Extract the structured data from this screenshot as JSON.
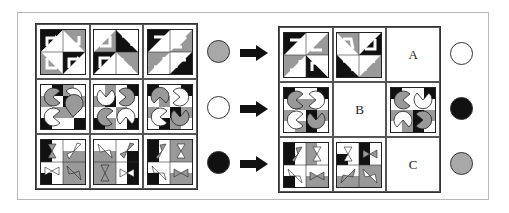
{
  "colors": {
    "black": "#111111",
    "gray": "#9a9a9a",
    "white": "#ffffff",
    "line": "#333333",
    "frame": "#b8b8b8"
  },
  "left_grid": {
    "rows": [
      {
        "pattern": "bent-arrows",
        "cells": [
          "arrows-1",
          "arrows-2",
          "arrows-3"
        ]
      },
      {
        "pattern": "pacman-tiles",
        "cells": [
          "pacman-1",
          "pacman-2",
          "pacman-3"
        ]
      },
      {
        "pattern": "bowtie-triangles",
        "cells": [
          "bowtie-1",
          "bowtie-2",
          "bowtie-3"
        ]
      }
    ]
  },
  "left_circles": [
    {
      "fill": "gray",
      "color": "#a8a8a8"
    },
    {
      "fill": "white",
      "color": "#ffffff"
    },
    {
      "fill": "black",
      "color": "#111111"
    }
  ],
  "arrows": [
    "right-arrow",
    "right-arrow",
    "right-arrow"
  ],
  "right_grid": {
    "rows": [
      {
        "cells": [
          "figure",
          "figure",
          "A"
        ]
      },
      {
        "cells": [
          "figure",
          "B",
          "figure"
        ]
      },
      {
        "cells": [
          "figure",
          "figure",
          "C"
        ]
      }
    ],
    "labels": {
      "a": "A",
      "b": "B",
      "c": "C"
    }
  },
  "right_circles": [
    {
      "fill": "white",
      "color": "#ffffff"
    },
    {
      "fill": "black",
      "color": "#111111"
    },
    {
      "fill": "gray",
      "color": "#a8a8a8"
    }
  ]
}
